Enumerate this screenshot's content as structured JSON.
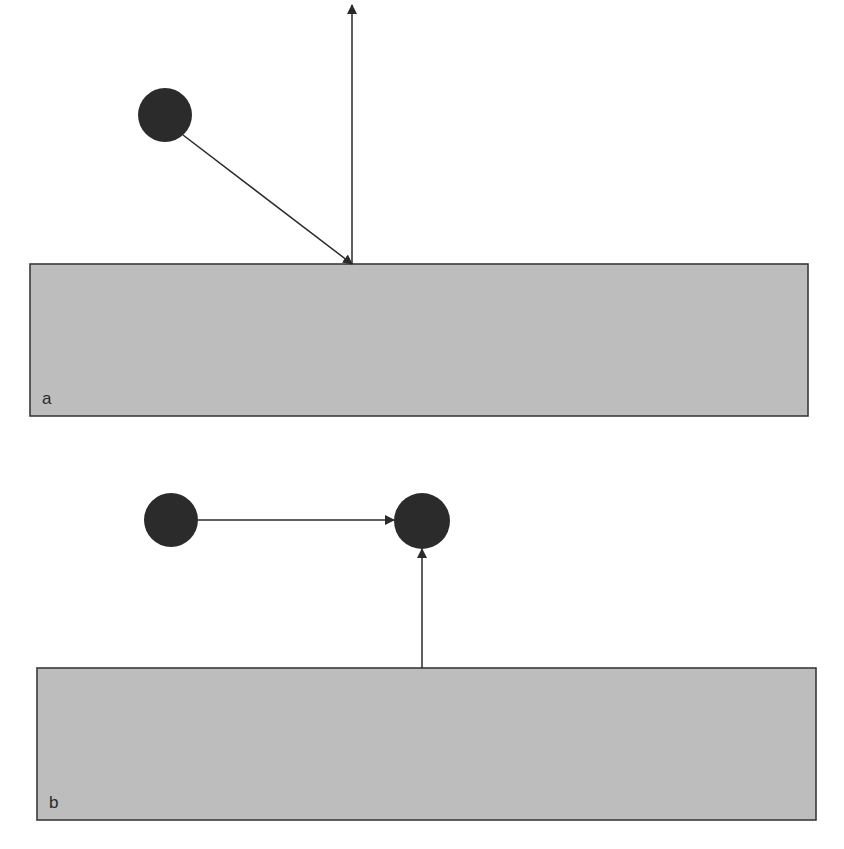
{
  "diagram": {
    "colors": {
      "surface_fill": "#bdbdbd",
      "surface_stroke": "#3a3a3a",
      "particle_fill": "#2b2b2b",
      "arrow_stroke": "#2a2a2a"
    },
    "panels": [
      {
        "id": "a",
        "label": "a",
        "surface": {
          "x": 30,
          "y": 264,
          "width": 778,
          "height": 152
        },
        "particles": [
          {
            "id": "incoming-particle",
            "cx": 165,
            "cy": 115,
            "r": 27
          }
        ],
        "arrows": [
          {
            "id": "incident-arrow",
            "x1": 183,
            "y1": 135,
            "x2": 352,
            "y2": 264,
            "description": "particle path toward surface"
          },
          {
            "id": "normal-arrow",
            "x1": 352,
            "y1": 264,
            "x2": 352,
            "y2": 5,
            "description": "outward arrow from surface"
          }
        ]
      },
      {
        "id": "b",
        "label": "b",
        "surface": {
          "x": 37,
          "y": 668,
          "width": 779,
          "height": 152
        },
        "particles": [
          {
            "id": "source-particle",
            "cx": 171,
            "cy": 520,
            "r": 27
          },
          {
            "id": "target-particle",
            "cx": 422,
            "cy": 521,
            "r": 28
          }
        ],
        "arrows": [
          {
            "id": "horizontal-arrow",
            "x1": 198,
            "y1": 520,
            "x2": 394,
            "y2": 520,
            "description": "arrow from source particle to target particle"
          },
          {
            "id": "surface-arrow",
            "x1": 422,
            "y1": 668,
            "x2": 422,
            "y2": 549,
            "description": "arrow from surface to target particle"
          }
        ]
      }
    ]
  }
}
